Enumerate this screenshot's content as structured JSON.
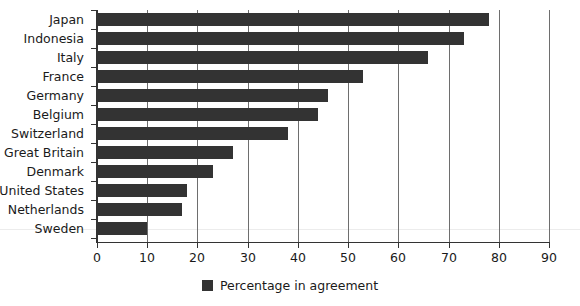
{
  "chart_data": {
    "type": "bar",
    "orientation": "horizontal",
    "title": "",
    "subtitle": "",
    "xlabel": "",
    "ylabel": "",
    "xlim": [
      0,
      90
    ],
    "xticks": [
      0,
      10,
      20,
      30,
      40,
      50,
      60,
      70,
      80,
      90
    ],
    "xtick_labels": [
      "0",
      "10",
      "20",
      "30",
      "40",
      "50",
      "60",
      "70",
      "80",
      "90"
    ],
    "grid": true,
    "grid_axis": "x",
    "legend_position": "bottom-center",
    "legend": [
      "Percentage in agreement"
    ],
    "series_color": "#333333",
    "categories": [
      "Japan",
      "Indonesia",
      "Italy",
      "France",
      "Germany",
      "Belgium",
      "Switzerland",
      "Great Britain",
      "Denmark",
      "United States",
      "Netherlands",
      "Sweden"
    ],
    "values": [
      78,
      73,
      66,
      53,
      46,
      44,
      38,
      27,
      23,
      18,
      17,
      10
    ],
    "series": [
      {
        "name": "Percentage in agreement",
        "color": "#333333",
        "values": [
          78,
          73,
          66,
          53,
          46,
          44,
          38,
          27,
          23,
          18,
          17,
          10
        ]
      }
    ]
  },
  "legend": {
    "label": "Percentage in agreement",
    "swatch_color": "#333333"
  },
  "axis": {
    "x_tick_labels": [
      "0",
      "10",
      "20",
      "30",
      "40",
      "50",
      "60",
      "70",
      "80",
      "90"
    ]
  },
  "colors": {
    "bar": "#333333",
    "grid": "#6e6e6e",
    "axis": "#333333",
    "text": "#1a1a1a",
    "background": "#ffffff"
  }
}
